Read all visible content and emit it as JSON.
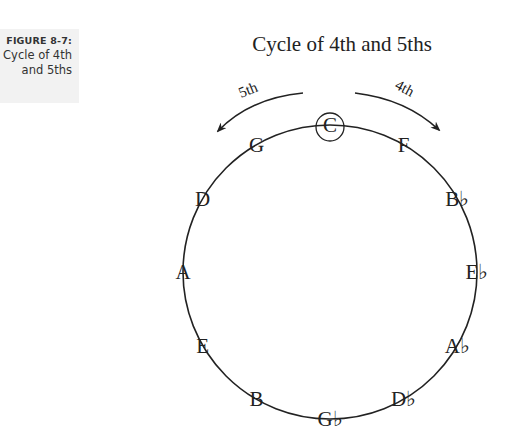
{
  "caption": {
    "figure_number": "FIGURE 8-7:",
    "line1": "Cycle of 4th",
    "line2": "and 5ths"
  },
  "diagram": {
    "title": "Cycle of 4th and 5ths",
    "arrow_left_label": "5th",
    "arrow_right_label": "4th",
    "center_note": "C",
    "notes": [
      {
        "label": "C",
        "angle": 0,
        "circled": true
      },
      {
        "label": "F",
        "angle": 30
      },
      {
        "label": "B♭",
        "angle": 60
      },
      {
        "label": "E♭",
        "angle": 90
      },
      {
        "label": "A♭",
        "angle": 120
      },
      {
        "label": "D♭",
        "angle": 150
      },
      {
        "label": "G♭",
        "angle": 180
      },
      {
        "label": "B",
        "angle": 210
      },
      {
        "label": "E",
        "angle": 240
      },
      {
        "label": "A",
        "angle": 270
      },
      {
        "label": "D",
        "angle": 300
      },
      {
        "label": "G",
        "angle": 330
      }
    ],
    "stroke_color": "#222222"
  }
}
